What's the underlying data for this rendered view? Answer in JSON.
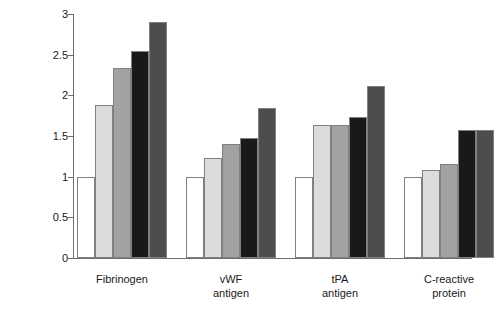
{
  "chart_data": {
    "type": "bar",
    "title": "",
    "xlabel": "",
    "ylabel": "Relative risk",
    "ylim": [
      0,
      3
    ],
    "yticks": [
      0,
      0.5,
      1,
      1.5,
      2,
      2.5,
      3
    ],
    "ytick_labels": [
      "0",
      "0.5",
      "1",
      "1.5",
      "2",
      "2.5",
      "3"
    ],
    "grid": false,
    "legend": "none",
    "categories": [
      "Fibrinogen",
      "vWF antigen",
      "tPA antigen",
      "C-reactive protein"
    ],
    "category_lines": [
      [
        "Fibrinogen",
        ""
      ],
      [
        "vWF",
        "antigen"
      ],
      [
        "tPA",
        "antigen"
      ],
      [
        "C-reactive",
        "protein"
      ]
    ],
    "series": [
      {
        "name": "Quintile 1",
        "color": "#ffffff",
        "values": [
          1.0,
          1.0,
          1.0,
          1.0
        ]
      },
      {
        "name": "Quintile 2",
        "color": "#dcdcdc",
        "values": [
          1.88,
          1.23,
          1.63,
          1.08
        ]
      },
      {
        "name": "Quintile 3",
        "color": "#a2a2a2",
        "values": [
          2.33,
          1.4,
          1.64,
          1.15
        ]
      },
      {
        "name": "Quintile 4",
        "color": "#191919",
        "values": [
          2.54,
          1.47,
          1.73,
          1.57
        ]
      },
      {
        "name": "Quintile 5",
        "color": "#4d4d4d",
        "values": [
          2.9,
          1.85,
          2.11,
          1.57
        ]
      }
    ]
  },
  "colors": {
    "axis": "#6e6e6e",
    "bar_outline": "#808080",
    "text": "#1a1a1a",
    "background": "#ffffff"
  }
}
